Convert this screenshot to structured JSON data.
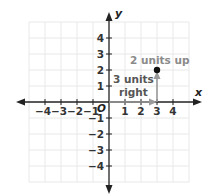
{
  "figure": {
    "type": "coordinate-plane",
    "axes": {
      "x_label": "x",
      "y_label": "y",
      "origin_label": "O",
      "x_ticks": [
        "−4",
        "−3",
        "−2",
        "−1",
        "1",
        "2",
        "3",
        "4"
      ],
      "y_ticks": [
        "4",
        "3",
        "2",
        "1",
        "−1",
        "−2",
        "−3",
        "−4"
      ],
      "range": [
        -5,
        5
      ]
    },
    "point": {
      "x": 3,
      "y": 2
    },
    "annotations": {
      "horizontal_move_line1": "3 units",
      "horizontal_move_line2": "right",
      "vertical_move": "2 units up"
    },
    "colors": {
      "grid": "#e6e6e6",
      "axis": "#222222",
      "annotation_text": "#8a8a8a",
      "arrow": "#9a9a9a",
      "point": "#111111",
      "label_dark": "#333333"
    }
  }
}
